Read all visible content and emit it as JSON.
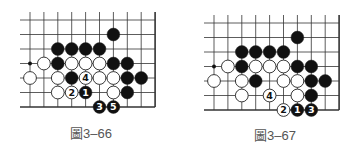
{
  "colors": {
    "line": "#333333",
    "black_stone": "#111111",
    "white_stone": "#ffffff",
    "stone_edge": "#222222",
    "caption": "#555555"
  },
  "diagrams": [
    {
      "caption": "圖3–66",
      "origin": {
        "x": 30,
        "y": 20
      },
      "spacing": {
        "x": 13.9,
        "y": 14.5
      },
      "cols": 10,
      "rows": 7,
      "open_left": true,
      "open_top": true,
      "star_points": [
        [
          0,
          3
        ]
      ],
      "stones": [
        {
          "c": 6,
          "r": 1,
          "color": "black"
        },
        {
          "c": 2,
          "r": 2,
          "color": "black"
        },
        {
          "c": 3,
          "r": 2,
          "color": "black"
        },
        {
          "c": 4,
          "r": 2,
          "color": "black"
        },
        {
          "c": 5,
          "r": 2,
          "color": "black"
        },
        {
          "c": 1,
          "r": 3,
          "color": "white"
        },
        {
          "c": 2,
          "r": 3,
          "color": "black"
        },
        {
          "c": 3,
          "r": 3,
          "color": "white"
        },
        {
          "c": 4,
          "r": 3,
          "color": "white"
        },
        {
          "c": 5,
          "r": 3,
          "color": "white"
        },
        {
          "c": 6,
          "r": 3,
          "color": "black"
        },
        {
          "c": 7,
          "r": 3,
          "color": "black"
        },
        {
          "c": 0,
          "r": 4,
          "color": "white"
        },
        {
          "c": 2,
          "r": 4,
          "color": "white"
        },
        {
          "c": 3,
          "r": 4,
          "color": "black"
        },
        {
          "c": 4,
          "r": 4,
          "color": "white",
          "label": "4"
        },
        {
          "c": 5,
          "r": 4,
          "color": "white"
        },
        {
          "c": 6,
          "r": 4,
          "color": "white"
        },
        {
          "c": 7,
          "r": 4,
          "color": "black"
        },
        {
          "c": 8,
          "r": 4,
          "color": "black"
        },
        {
          "c": 2,
          "r": 5,
          "color": "white"
        },
        {
          "c": 3,
          "r": 5,
          "color": "white",
          "label": "2"
        },
        {
          "c": 4,
          "r": 5,
          "color": "black",
          "label": "1"
        },
        {
          "c": 6,
          "r": 5,
          "color": "white"
        },
        {
          "c": 7,
          "r": 5,
          "color": "black"
        },
        {
          "c": 5,
          "r": 6,
          "color": "black",
          "label": "3"
        },
        {
          "c": 6,
          "r": 6,
          "color": "black",
          "label": "5"
        }
      ]
    },
    {
      "caption": "圖3–67",
      "origin": {
        "x": 214,
        "y": 23
      },
      "spacing": {
        "x": 13.9,
        "y": 14.5
      },
      "cols": 10,
      "rows": 7,
      "open_left": true,
      "open_top": true,
      "star_points": [
        [
          0,
          3
        ]
      ],
      "stones": [
        {
          "c": 6,
          "r": 1,
          "color": "black"
        },
        {
          "c": 2,
          "r": 2,
          "color": "black"
        },
        {
          "c": 3,
          "r": 2,
          "color": "black"
        },
        {
          "c": 4,
          "r": 2,
          "color": "black"
        },
        {
          "c": 5,
          "r": 2,
          "color": "black"
        },
        {
          "c": 1,
          "r": 3,
          "color": "white"
        },
        {
          "c": 2,
          "r": 3,
          "color": "black"
        },
        {
          "c": 3,
          "r": 3,
          "color": "white"
        },
        {
          "c": 4,
          "r": 3,
          "color": "white"
        },
        {
          "c": 5,
          "r": 3,
          "color": "white"
        },
        {
          "c": 6,
          "r": 3,
          "color": "black"
        },
        {
          "c": 7,
          "r": 3,
          "color": "black"
        },
        {
          "c": 0,
          "r": 4,
          "color": "white"
        },
        {
          "c": 2,
          "r": 4,
          "color": "white"
        },
        {
          "c": 3,
          "r": 4,
          "color": "black"
        },
        {
          "c": 5,
          "r": 4,
          "color": "white"
        },
        {
          "c": 6,
          "r": 4,
          "color": "white"
        },
        {
          "c": 7,
          "r": 4,
          "color": "black"
        },
        {
          "c": 8,
          "r": 4,
          "color": "black"
        },
        {
          "c": 2,
          "r": 5,
          "color": "white"
        },
        {
          "c": 4,
          "r": 5,
          "color": "white",
          "label": "4"
        },
        {
          "c": 6,
          "r": 5,
          "color": "white"
        },
        {
          "c": 7,
          "r": 5,
          "color": "black"
        },
        {
          "c": 5,
          "r": 6,
          "color": "white",
          "label": "2"
        },
        {
          "c": 6,
          "r": 6,
          "color": "black",
          "label": "1"
        },
        {
          "c": 7,
          "r": 6,
          "color": "black",
          "label": "3"
        }
      ]
    }
  ]
}
